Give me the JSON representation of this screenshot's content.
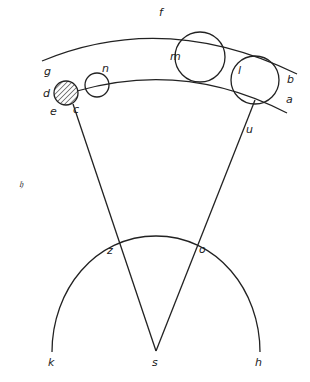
{
  "diagram": {
    "type": "geometric-astronomy-figure",
    "colors": {
      "ink": "#222222",
      "background": "#ffffff"
    },
    "labels": {
      "f": "f",
      "g": "g",
      "b": "b",
      "a": "a",
      "d": "d",
      "e": "e",
      "c": "c",
      "n": "n",
      "m": "m",
      "l": "l",
      "u": "u",
      "z": "z",
      "o": "o",
      "s": "s",
      "k": "k",
      "h": "h",
      "marginal_glyph": "𝔥"
    },
    "elements": {
      "outer_arc": "g-f-b",
      "orbit_arc": "d-n-m-l-a",
      "hatched_circle": "d-e-c",
      "circles": [
        "n",
        "m",
        "l"
      ],
      "lines": [
        "c-s",
        "s-u"
      ],
      "lower_arc": "k-z-o-h",
      "center_point": "s"
    }
  }
}
